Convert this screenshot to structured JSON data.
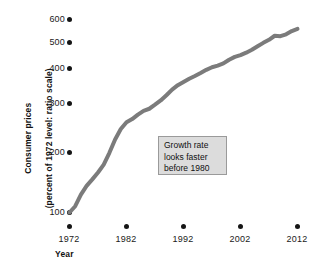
{
  "chart_data": {
    "type": "line",
    "title": "",
    "subtitle": "",
    "xlabel": "Year",
    "ylabel": "Consumer prices (percent of 1972 level: ratio scale)",
    "ylabel_line1": "Consumer prices",
    "ylabel_line2": "(percent of 1972 level: ratio scale)",
    "yscale": "log",
    "xscale": "linear",
    "grid": false,
    "legend": false,
    "xlim": [
      1972,
      2012
    ],
    "ylim": [
      100,
      600
    ],
    "yticks": [
      100,
      200,
      300,
      400,
      500,
      600
    ],
    "ytick_labels": [
      "100",
      "200",
      "300",
      "400",
      "500",
      "600"
    ],
    "xticks": [
      1972,
      1982,
      1992,
      2002,
      2012
    ],
    "xtick_labels": [
      "1972",
      "1982",
      "1992",
      "2002",
      "2012"
    ],
    "series": [
      {
        "name": "Consumer prices",
        "color": "#7b7b7b",
        "x": [
          1972,
          1973,
          1974,
          1975,
          1976,
          1977,
          1978,
          1979,
          1980,
          1981,
          1982,
          1983,
          1984,
          1985,
          1986,
          1987,
          1988,
          1989,
          1990,
          1991,
          1992,
          1993,
          1994,
          1995,
          1996,
          1997,
          1998,
          1999,
          2000,
          2001,
          2002,
          2003,
          2004,
          2005,
          2006,
          2007,
          2008,
          2009,
          2010,
          2011,
          2012
        ],
        "values": [
          100,
          106,
          118,
          128,
          136,
          145,
          156,
          174,
          197,
          217,
          231,
          238,
          248,
          257,
          262,
          272,
          283,
          297,
          313,
          326,
          336,
          346,
          355,
          365,
          376,
          385,
          391,
          399,
          413,
          424,
          431,
          441,
          453,
          468,
          483,
          497,
          516,
          514,
          523,
          539,
          550
        ]
      }
    ],
    "annotations": [
      {
        "name": "growth-rate-note",
        "line1": "Growth rate",
        "line2": "looks faster",
        "line3": "before 1980"
      }
    ]
  },
  "colors": {
    "line": "#7b7b7b",
    "tick_dot": "#151515",
    "text": "#1a1a1a",
    "annotation_fill": "#dcdcdc",
    "annotation_border": "#9a9a9a",
    "background": "#ffffff"
  }
}
